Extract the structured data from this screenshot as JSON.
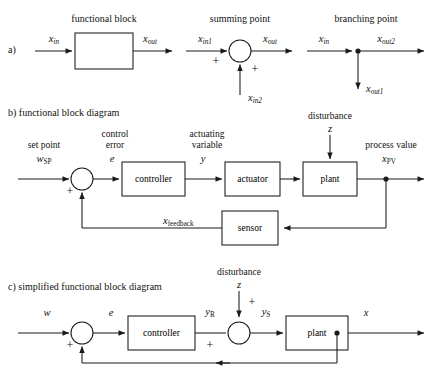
{
  "figure": {
    "title_a_headings": {
      "functional_block": "functional block",
      "summing_point": "summing point",
      "branching_point": "branching point"
    },
    "sections": {
      "a_label": "a)",
      "b_label": "b) functional block diagram",
      "c_label": "c) simplified functional block diagram"
    }
  },
  "part_a": {
    "functional_block": {
      "input_label": "x",
      "input_sub": "in",
      "output_label": "x",
      "output_sub": "out",
      "block_text": ""
    },
    "summing_point": {
      "input1_label": "x",
      "input1_sub": "in1",
      "input2_label": "x",
      "input2_sub": "in2",
      "output_label": "x",
      "output_sub": "out",
      "sign1": "+",
      "sign2": "+"
    },
    "branching_point": {
      "input_label": "x",
      "input_sub": "in",
      "output_h_label": "x",
      "output_h_sub": "out2",
      "output_v_label": "x",
      "output_v_sub": "out1"
    }
  },
  "part_b": {
    "set_point_caption": "set point",
    "set_point_var": "w",
    "set_point_sub": "SP",
    "control_error_caption_line1": "control",
    "control_error_caption_line2": "error",
    "control_error_var": "e",
    "actuating_caption_line1": "actuating",
    "actuating_caption_line2": "variable",
    "actuating_var": "y",
    "disturbance_caption": "disturbance",
    "disturbance_var": "z",
    "process_value_caption": "process value",
    "process_value_var": "x",
    "process_value_sub": "PV",
    "feedback_var": "x",
    "feedback_sub": "feedback",
    "sum_sign": "+",
    "blocks": {
      "controller": "controller",
      "actuator": "actuator",
      "plant": "plant",
      "sensor": "sensor"
    }
  },
  "part_c": {
    "set_point_var": "w",
    "control_error_var": "e",
    "controller_out_var": "y",
    "controller_out_sub": "R",
    "disturbance_caption": "disturbance",
    "disturbance_var": "z",
    "plant_in_var": "y",
    "plant_in_sub": "S",
    "output_var": "x",
    "sum1_sign": "+",
    "sum2_sign_left": "+",
    "sum2_sign_top": "+",
    "blocks": {
      "controller": "controller",
      "plant": "plant"
    }
  },
  "style": {
    "line_color": "#1a1a1a",
    "background": "#ffffff"
  }
}
